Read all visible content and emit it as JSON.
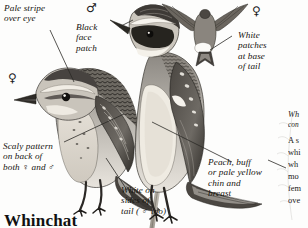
{
  "page": {
    "width": 308,
    "height": 228,
    "background": "#fdfdfc",
    "ink": "#15130f",
    "plate_type": "grayscale bird illustration plate"
  },
  "heading": {
    "text": "Whinchat",
    "clipped": "bottom edge of image crops the heading"
  },
  "labels": {
    "pale_stripe": "Pale stripe\nover eye",
    "black_face": "Black\nface\npatch",
    "white_patches": "White\npatches\nat base\nof tail",
    "scaly_pattern": "Scaly pattern\non back of\nboth ♀ and ♂",
    "white_sides": "White on\nsides of\ntail ( ♂ too)",
    "peach_buff": "Peach, buff\nor pale yellow\nchin and\nbreast"
  },
  "symbols": {
    "female_left": "♀",
    "male_top": "♂",
    "female_flight": "♀"
  },
  "right_column": {
    "line1": "Wh",
    "line2": "con",
    "line3": "A s",
    "line4": "whi",
    "line5": "wh",
    "line6": "mo",
    "line7": "fem",
    "line8": "ove"
  },
  "figures": {
    "female_perched": "female whinchat perched, head facing left",
    "male_perched": "male whinchat perched upright on stem",
    "female_flight": "female whinchat in flight from behind, tail spread"
  }
}
